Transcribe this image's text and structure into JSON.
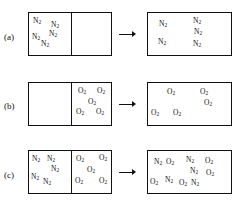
{
  "figure": {
    "background_color": "#ffffff",
    "line_color": "#111111"
  },
  "molecule_labels": {
    "nitrogen": "N",
    "nitrogen_sub": "2",
    "oxygen": "O",
    "oxygen_sub": "2"
  },
  "arrow": {
    "symbol": "→",
    "name": "process-arrow"
  },
  "panels": [
    {
      "id": "a",
      "label": "(a)",
      "before": {
        "has_divider": true,
        "left_compartment": {
          "species": "N2",
          "count": 5,
          "molecules": [
            {
              "species": "N2",
              "x": 4,
              "y": 4
            },
            {
              "species": "N2",
              "x": 22,
              "y": 8
            },
            {
              "species": "N2",
              "x": 3,
              "y": 20
            },
            {
              "species": "N2",
              "x": 20,
              "y": 17
            },
            {
              "species": "N2",
              "x": 12,
              "y": 27
            }
          ]
        },
        "right_compartment": {
          "species": "vacuum",
          "count": 0,
          "molecules": []
        }
      },
      "after": {
        "has_divider": false,
        "species": "N2",
        "count": 6,
        "molecules": [
          {
            "species": "N2",
            "x": 11,
            "y": 7
          },
          {
            "species": "N2",
            "x": 45,
            "y": 4
          },
          {
            "species": "N2",
            "x": 46,
            "y": 15
          },
          {
            "species": "N2",
            "x": 10,
            "y": 25
          },
          {
            "species": "N2",
            "x": 45,
            "y": 27
          }
        ]
      }
    },
    {
      "id": "b",
      "label": "(b)",
      "before": {
        "has_divider": true,
        "left_compartment": {
          "species": "vacuum",
          "count": 0,
          "molecules": []
        },
        "right_compartment": {
          "species": "O2",
          "count": 5,
          "molecules": [
            {
              "species": "O2",
              "x": 5,
              "y": 4
            },
            {
              "species": "O2",
              "x": 24,
              "y": 4
            },
            {
              "species": "O2",
              "x": 15,
              "y": 15
            },
            {
              "species": "O2",
              "x": 3,
              "y": 25
            },
            {
              "species": "O2",
              "x": 23,
              "y": 25
            }
          ]
        }
      },
      "after": {
        "has_divider": false,
        "species": "O2",
        "count": 5,
        "molecules": [
          {
            "species": "O2",
            "x": 19,
            "y": 5
          },
          {
            "species": "O2",
            "x": 52,
            "y": 5
          },
          {
            "species": "O2",
            "x": 56,
            "y": 16
          },
          {
            "species": "O2",
            "x": 3,
            "y": 26
          },
          {
            "species": "O2",
            "x": 25,
            "y": 26
          }
        ]
      }
    },
    {
      "id": "c",
      "label": "(c)",
      "before": {
        "has_divider": true,
        "left_compartment": {
          "species": "N2",
          "count": 5,
          "molecules": [
            {
              "species": "N2",
              "x": 3,
              "y": 4
            },
            {
              "species": "N2",
              "x": 18,
              "y": 4
            },
            {
              "species": "N2",
              "x": 22,
              "y": 14
            },
            {
              "species": "N2",
              "x": 2,
              "y": 22
            },
            {
              "species": "N2",
              "x": 14,
              "y": 27
            }
          ]
        },
        "right_compartment": {
          "species": "O2",
          "count": 5,
          "molecules": [
            {
              "species": "O2",
              "x": 3,
              "y": 4
            },
            {
              "species": "O2",
              "x": 26,
              "y": 3
            },
            {
              "species": "O2",
              "x": 14,
              "y": 15
            },
            {
              "species": "O2",
              "x": 2,
              "y": 26
            },
            {
              "species": "O2",
              "x": 26,
              "y": 26
            }
          ]
        }
      },
      "after": {
        "has_divider": false,
        "species": "mixture",
        "count": 10,
        "molecules": [
          {
            "species": "N2",
            "x": 6,
            "y": 7
          },
          {
            "species": "O2",
            "x": 18,
            "y": 7
          },
          {
            "species": "N2",
            "x": 38,
            "y": 5
          },
          {
            "species": "O2",
            "x": 57,
            "y": 6
          },
          {
            "species": "N2",
            "x": 42,
            "y": 16
          },
          {
            "species": "O2",
            "x": 58,
            "y": 18
          },
          {
            "species": "O2",
            "x": 2,
            "y": 27
          },
          {
            "species": "N2",
            "x": 17,
            "y": 25
          },
          {
            "species": "O2",
            "x": 31,
            "y": 28
          },
          {
            "species": "N2",
            "x": 43,
            "y": 28
          }
        ]
      }
    }
  ],
  "geometry": {
    "panel_tops": [
      12,
      82,
      150
    ],
    "label_tops": [
      32,
      101,
      170
    ],
    "box_height": 44,
    "before_box_left": 28,
    "before_box_width": 84,
    "divider_offset": 42,
    "arrow_left": 119,
    "arrow_width": 18,
    "after_box_left": 147,
    "after_box_width": 85
  }
}
